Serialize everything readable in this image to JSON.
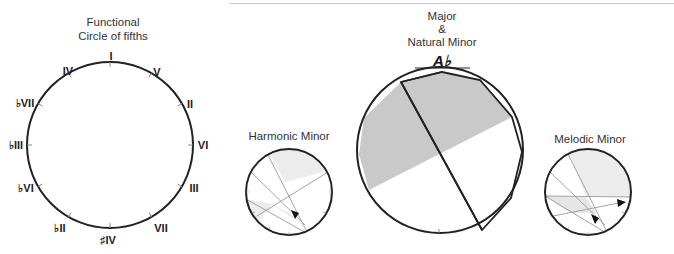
{
  "diagrams": {
    "functional": {
      "title_line1": "Functional",
      "title_line2": "Circle of fifths",
      "degrees": [
        "I",
        "V",
        "II",
        "VI",
        "III",
        "VII",
        "♯IV",
        "♭II",
        "♭VI",
        "♭III",
        "♭VII",
        "IV"
      ]
    },
    "harmonic_minor": {
      "title": "Harmonic Minor"
    },
    "major_natural_minor": {
      "title_line1": "Major",
      "title_line2": "&",
      "title_line3": "Natural Minor",
      "key_label": "A♭"
    },
    "melodic_minor": {
      "title": "Melodic Minor"
    }
  },
  "colors": {
    "stroke": "#222222",
    "shade_main": "#c9c9c9",
    "shade_light": "#ececec",
    "thin_line": "#9a9a9a"
  }
}
